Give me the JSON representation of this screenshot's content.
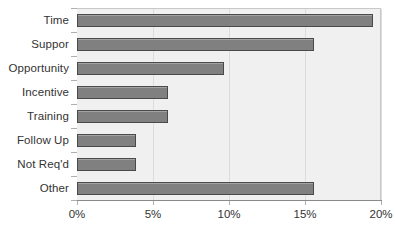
{
  "chart_data": {
    "type": "bar",
    "orientation": "horizontal",
    "title": "",
    "xlabel": "",
    "ylabel": "",
    "categories": [
      "Time",
      "Suppor",
      "Opportunity",
      "Incentive",
      "Training",
      "Follow Up",
      "Not Req'd",
      "Other"
    ],
    "values": [
      19.5,
      15.6,
      9.7,
      6.0,
      6.0,
      3.9,
      3.9,
      15.6
    ],
    "value_suffix": "%",
    "xlim": [
      0,
      20
    ],
    "xticks": [
      0,
      5,
      10,
      15,
      20
    ],
    "xtick_labels": [
      "0%",
      "5%",
      "10%",
      "15%",
      "20%"
    ],
    "grid": true,
    "grid_axis": "x",
    "legend": false,
    "colors": {
      "bar_fill": "#808080",
      "bar_border": "#4a4a4a",
      "plot_background": "#f0f0f0",
      "gridline": "#dcdcdc",
      "axis_line": "#8a8a8a",
      "text": "#333333",
      "page_background": "#ffffff"
    }
  }
}
